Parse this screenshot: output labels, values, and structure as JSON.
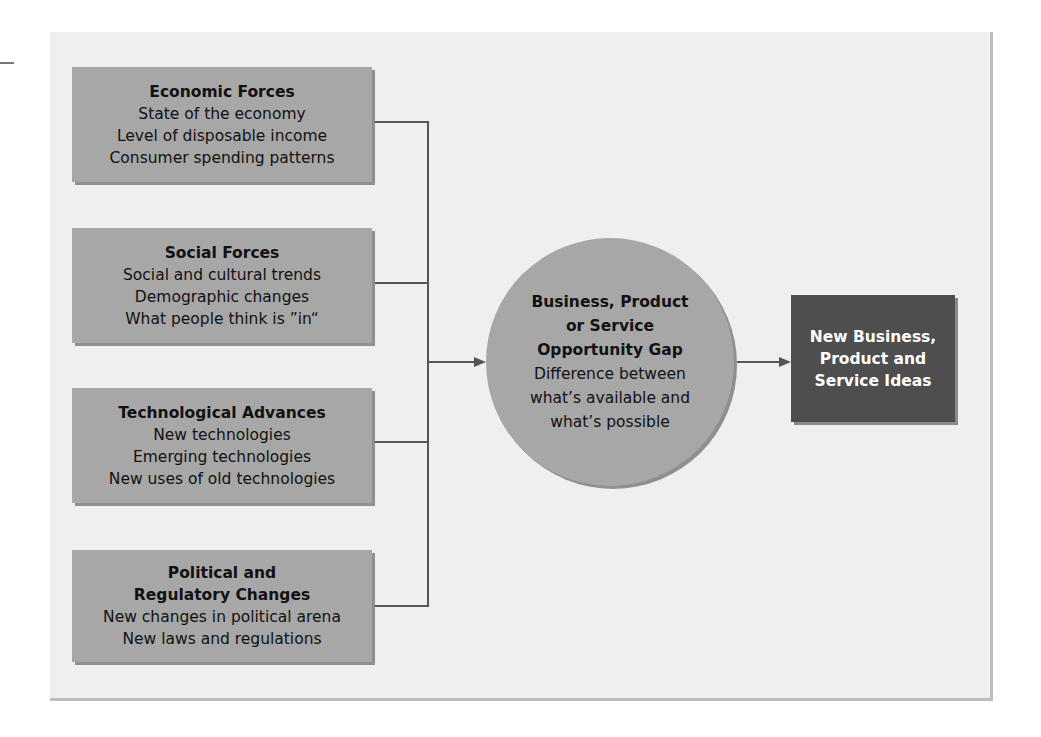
{
  "forces": [
    {
      "title": "Economic Forces",
      "lines": [
        "State of the economy",
        "Level of disposable income",
        "Consumer spending patterns"
      ]
    },
    {
      "title": "Social Forces",
      "lines": [
        "Social and cultural trends",
        "Demographic changes",
        "What people think is ”in“"
      ]
    },
    {
      "title": "Technological Advances",
      "lines": [
        "New technologies",
        "Emerging technologies",
        "New uses of old technologies"
      ]
    },
    {
      "title_lines": [
        "Political and",
        "Regulatory Changes"
      ],
      "lines": [
        "New changes in political arena",
        "New laws and regulations"
      ]
    }
  ],
  "gap": {
    "title_lines": [
      "Business, Product",
      "or Service",
      "Opportunity Gap"
    ],
    "lines": [
      "Difference between",
      "what’s available and",
      "what’s possible"
    ]
  },
  "outcome": {
    "lines": [
      "New Business,",
      "Product and",
      "Service Ideas"
    ]
  },
  "colors": {
    "box": "#a7a7a7",
    "outcome": "#4e4e4e",
    "panel": "#efefef"
  }
}
